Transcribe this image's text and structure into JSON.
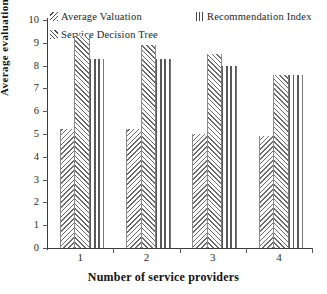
{
  "chart_data": {
    "type": "bar",
    "title": "",
    "xlabel": "Number of service providers",
    "ylabel": "Average evaluation",
    "categories": [
      "1",
      "2",
      "3",
      "4"
    ],
    "ylim": [
      0,
      10
    ],
    "yticks": [
      0,
      1,
      2,
      3,
      4,
      5,
      6,
      7,
      8,
      9,
      10
    ],
    "grid": false,
    "legend_position": "top",
    "series": [
      {
        "name": "Average Valuation",
        "pattern": "diagonal-down-hatch",
        "values": [
          5.2,
          5.2,
          5.0,
          4.9
        ]
      },
      {
        "name": "Service Decision Tree",
        "pattern": "diagonal-up-hatch",
        "values": [
          9.3,
          8.9,
          8.5,
          7.6
        ]
      },
      {
        "name": "Recommendation Index",
        "pattern": "vertical-stripes",
        "values": [
          8.3,
          8.3,
          8.0,
          7.6
        ]
      }
    ]
  },
  "legend": {
    "items": [
      {
        "label": "Average Valuation"
      },
      {
        "label": "Recommendation Index"
      },
      {
        "label": "Service Decision Tree"
      }
    ]
  },
  "axes": {
    "y_title": "Average evaluation",
    "x_title": "Number of service providers",
    "y_tick_labels": [
      "10",
      "9",
      "8",
      "7",
      "6",
      "5",
      "4",
      "3",
      "2",
      "1",
      "0"
    ],
    "x_tick_labels": [
      "1",
      "2",
      "3",
      "4"
    ]
  },
  "colors": {
    "axis": "#3a3a3a",
    "hatch": "#6b6b6b",
    "text": "#1a1a1a",
    "background": "#ffffff"
  }
}
